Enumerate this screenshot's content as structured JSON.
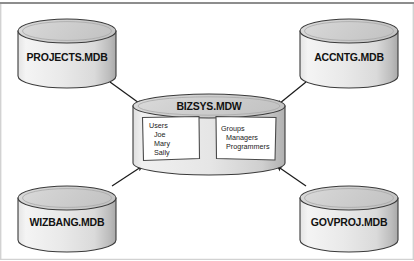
{
  "diagram": {
    "type": "workgroup-database-relationship",
    "frame": {
      "top_rule_color": "#8d8d8d",
      "border_color": "#cfcfcf",
      "background": "#ffffff"
    },
    "palette": {
      "cylinder_fill_light": "#f2f2f2",
      "cylinder_fill_mid": "#d8d8d8",
      "cylinder_fill_dark": "#b9b9b9",
      "cylinder_top_fill": "#d4d4d4",
      "outline": "#333333",
      "arrow_color": "#1c1c1c",
      "box_fill": "#ffffff",
      "box_border": "#4a4a4a",
      "text_color": "#111111"
    },
    "central": {
      "name": "bizsys-mdw",
      "label": "BIZSYS.MDW",
      "boxes": [
        {
          "name": "users-box",
          "lines": [
            "Users",
            "Joe",
            "Mary",
            "Sally"
          ],
          "indents": [
            0,
            1,
            1,
            1
          ]
        },
        {
          "name": "groups-box",
          "lines": [
            "Groups",
            "Managers",
            "Programmers"
          ],
          "indents": [
            0,
            1,
            1
          ]
        }
      ]
    },
    "databases": [
      {
        "name": "projects-mdb",
        "label": "PROJECTS.MDB",
        "position": "top-left"
      },
      {
        "name": "accntg-mdb",
        "label": "ACCNTG.MDB",
        "position": "top-right"
      },
      {
        "name": "wizbang-mdb",
        "label": "WIZBANG.MDB",
        "position": "bottom-left"
      },
      {
        "name": "govproj-mdb",
        "label": "GOVPROJ.MDB",
        "position": "bottom-right"
      }
    ],
    "connections": [
      {
        "name": "arrow-projects-to-bizsys",
        "from": "projects-mdb",
        "to": "bizsys-mdw",
        "direction": "to-center"
      },
      {
        "name": "arrow-accntg-to-bizsys",
        "from": "accntg-mdb",
        "to": "bizsys-mdw",
        "direction": "to-center"
      },
      {
        "name": "arrow-wizbang-to-bizsys",
        "from": "wizbang-mdb",
        "to": "bizsys-mdw",
        "direction": "to-center"
      },
      {
        "name": "arrow-govproj-to-bizsys",
        "from": "govproj-mdb",
        "to": "bizsys-mdw",
        "direction": "to-center"
      }
    ]
  }
}
